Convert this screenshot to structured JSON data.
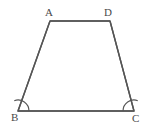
{
  "figure": {
    "type": "geometry-diagram",
    "shape_name": "trapezoid",
    "background_color": "#ffffff",
    "stroke_color": "#555555",
    "label_color": "#4a4a4a",
    "stroke_width": 1.4,
    "canvas": {
      "width": 152,
      "height": 130
    },
    "vertices": [
      {
        "id": "A",
        "label": "A",
        "x": 50,
        "y": 21,
        "label_x": 45,
        "label_y": 7
      },
      {
        "id": "D",
        "label": "D",
        "x": 110,
        "y": 21,
        "label_x": 104,
        "label_y": 7
      },
      {
        "id": "C",
        "label": "C",
        "x": 134,
        "y": 111,
        "label_x": 132,
        "label_y": 113
      },
      {
        "id": "B",
        "label": "B",
        "x": 18,
        "y": 111,
        "label_x": 11,
        "label_y": 112
      }
    ],
    "edges": [
      {
        "id": "AD",
        "from": "A",
        "to": "D",
        "name": "top-side"
      },
      {
        "id": "DC",
        "from": "D",
        "to": "C",
        "name": "right-side"
      },
      {
        "id": "CB",
        "from": "C",
        "to": "B",
        "name": "bottom-side"
      },
      {
        "id": "BA",
        "from": "B",
        "to": "A",
        "name": "left-side"
      }
    ],
    "polygon_points": "50,21 110,21 134,111 18,111",
    "angle_marks": [
      {
        "id": "angle-B",
        "at_vertex": "B",
        "radius": 11,
        "path": "M 29,111 A 11,11 0 0 0 14.25,100.65"
      },
      {
        "id": "angle-C",
        "at_vertex": "C",
        "radius": 11,
        "path": "M 137.75,100.65 A 11,11 0 0 0 123,111"
      }
    ]
  }
}
